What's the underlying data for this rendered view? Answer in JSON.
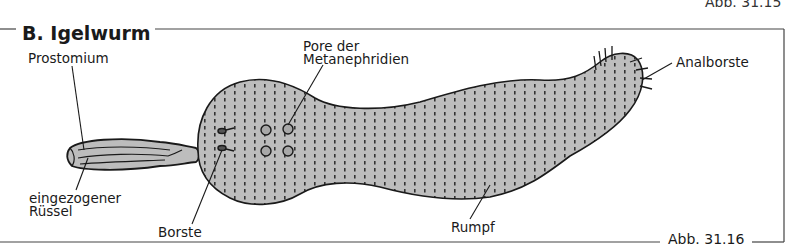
{
  "figure": {
    "section_title": "B. Igelwurm",
    "caption": "Abb. 31.16",
    "previous_caption": "Abb. 31.15",
    "labels": {
      "prostomium": "Prostomium",
      "pore_line1": "Pore der",
      "pore_line2": "Metanephridien",
      "analborste": "Analborste",
      "ruessel_line1": "eingezogener",
      "ruessel_line2": "Rüssel",
      "borste": "Borste",
      "rumpf": "Rumpf"
    },
    "colors": {
      "body_fill": "#bdbdbd",
      "outline": "#1a1a1a",
      "frame_line": "#444444",
      "background": "#ffffff"
    }
  }
}
